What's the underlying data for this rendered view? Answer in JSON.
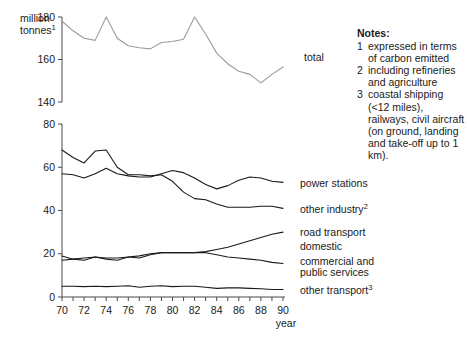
{
  "labels": {
    "unit_line1": "million",
    "unit_line2": "tonnes",
    "unit_superscript": "1",
    "xaxis_name": "year"
  },
  "notes": {
    "title": "Notes:",
    "items": [
      {
        "num": "1",
        "text": "expressed in terms of carbon emitted"
      },
      {
        "num": "2",
        "text": "including refineries and agriculture"
      },
      {
        "num": "3",
        "text": "coastal shipping (<12 miles), railways, civil aircraft (on ground, landing and take-off up to 1 km)."
      }
    ]
  },
  "chart_data": {
    "type": "line",
    "title": "",
    "xlabel": "year",
    "ylabel": "million tonnes",
    "grid": false,
    "legend_position": "right-of-plot",
    "x": [
      70,
      71,
      72,
      73,
      74,
      75,
      76,
      77,
      78,
      79,
      80,
      81,
      82,
      83,
      84,
      85,
      86,
      87,
      88,
      89,
      90
    ],
    "xticks": [
      "70",
      "72",
      "74",
      "76",
      "78",
      "80",
      "82",
      "84",
      "86",
      "88",
      "90"
    ],
    "panels": [
      {
        "name": "total-panel",
        "ylim": [
          140,
          180
        ],
        "yticks": [
          140,
          160,
          180
        ],
        "series": [
          {
            "name": "total",
            "label": "total",
            "color": "#9b9b9b",
            "values": [
              178.0,
              173.5,
              170.0,
              169.0,
              180.0,
              170.0,
              166.5,
              165.5,
              165.0,
              168.0,
              168.5,
              169.5,
              180.0,
              172.0,
              163.0,
              158.0,
              154.5,
              153.0,
              149.0,
              153.0,
              156.5
            ]
          }
        ]
      },
      {
        "name": "sectors-panel",
        "ylim": [
          0,
          80
        ],
        "yticks": [
          0,
          20,
          40,
          60,
          80
        ],
        "series": [
          {
            "name": "power-stations",
            "label": "power stations",
            "color": "#1a1a1a",
            "values": [
              57.0,
              56.5,
              55.0,
              57.0,
              59.5,
              57.0,
              56.0,
              55.5,
              55.5,
              57.0,
              58.5,
              57.5,
              55.0,
              52.0,
              50.0,
              51.5,
              54.0,
              55.5,
              55.0,
              53.5,
              53.0
            ]
          },
          {
            "name": "other-industry",
            "label": "other industry",
            "label_superscript": "2",
            "color": "#1a1a1a",
            "values": [
              68.0,
              64.5,
              62.0,
              67.5,
              68.0,
              60.0,
              56.5,
              56.5,
              56.0,
              56.5,
              53.5,
              48.5,
              45.5,
              45.0,
              43.0,
              41.5,
              41.5,
              41.5,
              42.0,
              42.0,
              41.0
            ]
          },
          {
            "name": "road-transport",
            "label": "road transport",
            "color": "#1a1a1a",
            "values": [
              17.0,
              17.5,
              18.0,
              18.5,
              18.0,
              18.0,
              18.5,
              19.0,
              20.0,
              20.5,
              20.5,
              20.5,
              20.5,
              21.0,
              22.0,
              23.0,
              24.5,
              26.0,
              27.5,
              29.0,
              30.0
            ]
          },
          {
            "name": "domestic-and-commercial",
            "label": "domestic",
            "label2": "commercial and",
            "label3": "public services",
            "color": "#1a1a1a",
            "values": [
              19.0,
              17.5,
              17.0,
              18.5,
              17.5,
              17.0,
              18.5,
              18.0,
              19.5,
              20.5,
              20.5,
              20.5,
              20.5,
              20.5,
              19.5,
              18.5,
              18.0,
              17.5,
              17.0,
              16.0,
              15.5
            ]
          },
          {
            "name": "other-transport",
            "label": "other transport",
            "label_superscript": "3",
            "color": "#1a1a1a",
            "values": [
              5.0,
              5.0,
              4.8,
              5.0,
              4.8,
              5.0,
              5.2,
              4.5,
              5.0,
              5.2,
              4.8,
              5.0,
              5.0,
              4.5,
              4.0,
              4.2,
              4.2,
              4.0,
              3.8,
              3.5,
              3.5
            ]
          }
        ]
      }
    ],
    "series_label_positions": [
      {
        "key": "total",
        "x": 304,
        "y": 61
      },
      {
        "key": "power-stations",
        "x": 300,
        "y": 187
      },
      {
        "key": "other-industry",
        "x": 300,
        "y": 213
      },
      {
        "key": "road-transport",
        "x": 300,
        "y": 236
      },
      {
        "key": "domestic",
        "x": 300,
        "y": 250
      },
      {
        "key": "commercial",
        "x": 300,
        "y": 265
      },
      {
        "key": "public-services",
        "x": 300,
        "y": 276
      },
      {
        "key": "other-transport",
        "x": 300,
        "y": 294
      }
    ]
  }
}
